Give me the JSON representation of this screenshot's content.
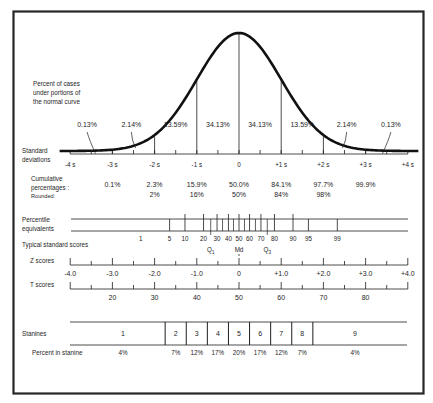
{
  "colors": {
    "ink": "#1e1e1e",
    "frame": "#262626",
    "background": "#ffffff"
  },
  "labels": {
    "percent_cases": [
      "Percent of cases",
      "under portions of",
      "the normal curve"
    ],
    "standard_deviations": [
      "Standard",
      "deviations"
    ],
    "cumulative": [
      "Cumulative",
      "percentages :",
      "Rounded:"
    ],
    "percentile": [
      "Percentile",
      "equivalents"
    ],
    "typical": "Typical standard scores",
    "z_scores": "Z scores",
    "t_scores": "T scores",
    "stanines": "Stanines",
    "percent_in_stanine": "Percent in stanine"
  },
  "chart_data": {
    "type": "line",
    "sd_ticks": [
      "-4 s",
      "-3 s",
      "-2 s",
      "-1 s",
      "0",
      "+1 s",
      "+2 s",
      "+3 s",
      "+4 s"
    ],
    "area_percentages": [
      {
        "from": -4,
        "to": -3,
        "label": "0.13%"
      },
      {
        "from": -3,
        "to": -2,
        "label": "2.14%"
      },
      {
        "from": -2,
        "to": -1,
        "label": "13.59%"
      },
      {
        "from": -1,
        "to": 0,
        "label": "34.13%"
      },
      {
        "from": 0,
        "to": 1,
        "label": "34.13%"
      },
      {
        "from": 1,
        "to": 2,
        "label": "13.59%"
      },
      {
        "from": 2,
        "to": 3,
        "label": "2.14%"
      },
      {
        "from": 3,
        "to": 4,
        "label": "0.13%"
      }
    ],
    "cumulative_percentages": [
      {
        "sd": -3,
        "value": "0.1%",
        "rounded": ""
      },
      {
        "sd": -2,
        "value": "2.3%",
        "rounded": "2%"
      },
      {
        "sd": -1,
        "value": "15.9%",
        "rounded": "16%"
      },
      {
        "sd": 0,
        "value": "50.0%",
        "rounded": "50%"
      },
      {
        "sd": 1,
        "value": "84.1%",
        "rounded": "84%"
      },
      {
        "sd": 2,
        "value": "97.7%",
        "rounded": "98%"
      },
      {
        "sd": 3,
        "value": "99.9%",
        "rounded": ""
      }
    ],
    "percentile_equivalents": [
      {
        "p": 1,
        "z": -2.33,
        "tick": false
      },
      {
        "p": 5,
        "z": -1.645,
        "tick": true
      },
      {
        "p": 10,
        "z": -1.28,
        "tick": true
      },
      {
        "p": 20,
        "z": -0.84,
        "tick": true
      },
      {
        "p": 30,
        "z": -0.52,
        "tick": true
      },
      {
        "p": 40,
        "z": -0.25,
        "tick": true
      },
      {
        "p": 50,
        "z": 0,
        "tick": true
      },
      {
        "p": 60,
        "z": 0.25,
        "tick": true
      },
      {
        "p": 70,
        "z": 0.52,
        "tick": true
      },
      {
        "p": 80,
        "z": 0.84,
        "tick": true
      },
      {
        "p": 90,
        "z": 1.28,
        "tick": true
      },
      {
        "p": 95,
        "z": 1.645,
        "tick": true
      },
      {
        "p": 99,
        "z": 2.33,
        "tick": true
      }
    ],
    "percentile_minor_z": [
      -0.67,
      -0.39,
      -0.13,
      0.13,
      0.39,
      0.67
    ],
    "quartiles": [
      {
        "label": "Q",
        "sub": "1",
        "z": -0.67
      },
      {
        "label": "Md",
        "sub": "",
        "z": 0
      },
      {
        "label": "Q",
        "sub": "3",
        "z": 0.67
      }
    ],
    "z_scores": [
      "-4.0",
      "-3.0",
      "-2.0",
      "-1.0",
      "0",
      "+1.0",
      "+2.0",
      "+3.0",
      "+4.0"
    ],
    "t_scores": [
      {
        "z": -3,
        "label": "20"
      },
      {
        "z": -2,
        "label": "30"
      },
      {
        "z": -1,
        "label": "40"
      },
      {
        "z": 0,
        "label": "50"
      },
      {
        "z": 1,
        "label": "60"
      },
      {
        "z": 2,
        "label": "70"
      },
      {
        "z": 3,
        "label": "80"
      }
    ],
    "stanines": [
      {
        "n": "1",
        "percent": "4%",
        "from": -4,
        "to": -1.75
      },
      {
        "n": "2",
        "percent": "7%",
        "from": -1.75,
        "to": -1.25
      },
      {
        "n": "3",
        "percent": "12%",
        "from": -1.25,
        "to": -0.75
      },
      {
        "n": "4",
        "percent": "17%",
        "from": -0.75,
        "to": -0.25
      },
      {
        "n": "5",
        "percent": "20%",
        "from": -0.25,
        "to": 0.25
      },
      {
        "n": "6",
        "percent": "17%",
        "from": 0.25,
        "to": 0.75
      },
      {
        "n": "7",
        "percent": "12%",
        "from": 0.75,
        "to": 1.25
      },
      {
        "n": "8",
        "percent": "7%",
        "from": 1.25,
        "to": 1.75
      },
      {
        "n": "9",
        "percent": "4%",
        "from": 1.75,
        "to": 4
      }
    ],
    "xlim": [
      -4,
      4
    ]
  }
}
